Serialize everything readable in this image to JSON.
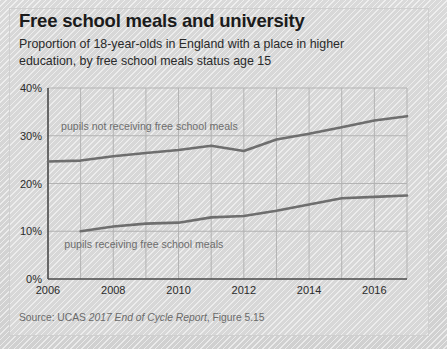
{
  "card": {
    "title": "Free school meals and university",
    "subtitle": "Proportion of 18-year-olds in England with a place in higher education, by free school meals status age 15",
    "source_prefix": "Source: UCAS ",
    "source_italic": "2017 End of Cycle Report",
    "source_suffix": ", Figure 5.15"
  },
  "chart_data": {
    "type": "line",
    "title": "Free school meals and university",
    "subtitle": "Proportion of 18-year-olds in England with a place in higher education, by free school meals status age 15",
    "xlabel": "",
    "ylabel": "",
    "xlim": [
      2006,
      2017
    ],
    "ylim": [
      0,
      40
    ],
    "grid": true,
    "legend_position": "inline-annotation",
    "x_tick_labels": [
      "2006",
      "2008",
      "2010",
      "2012",
      "2014",
      "2016"
    ],
    "x_tick_values": [
      2006,
      2008,
      2010,
      2012,
      2014,
      2016
    ],
    "y_tick_labels": [
      "0%",
      "10%",
      "20%",
      "30%",
      "40%"
    ],
    "y_tick_values": [
      0,
      10,
      20,
      30,
      40
    ],
    "x": [
      2006,
      2007,
      2008,
      2009,
      2010,
      2011,
      2012,
      2013,
      2014,
      2015,
      2016,
      2017
    ],
    "series": [
      {
        "name": "pupils not receiving free school meals",
        "color": "#6e6e6e",
        "x": [
          2006,
          2007,
          2008,
          2009,
          2010,
          2011,
          2012,
          2013,
          2014,
          2015,
          2016,
          2017
        ],
        "values": [
          24.6,
          24.8,
          25.7,
          26.4,
          27.0,
          27.9,
          26.8,
          29.2,
          30.4,
          31.8,
          33.2,
          34.1
        ],
        "annotation": "pupils not receiving free school meals",
        "annotation_x": 2006.4,
        "annotation_y": 31.3
      },
      {
        "name": "pupils receiving free school meals",
        "color": "#6e6e6e",
        "x": [
          2007,
          2008,
          2009,
          2010,
          2011,
          2012,
          2013,
          2014,
          2015,
          2016,
          2017
        ],
        "values": [
          10.0,
          11.0,
          11.6,
          11.8,
          12.9,
          13.2,
          14.3,
          15.6,
          16.9,
          17.2,
          17.5
        ],
        "annotation": "pupils receiving free school meals",
        "annotation_x": 2006.5,
        "annotation_y": 6.4
      }
    ]
  }
}
